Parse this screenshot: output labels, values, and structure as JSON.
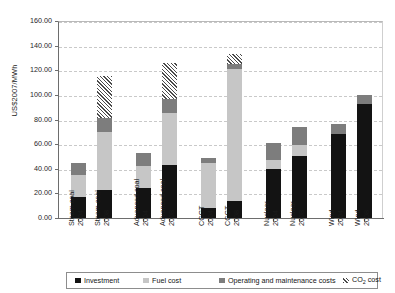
{
  "chart_data": {
    "type": "bar",
    "subtype": "stacked-bar",
    "title": "",
    "xlabel": "",
    "ylabel": "US$2007/MWh",
    "ylim": [
      0,
      160
    ],
    "ytick_step": 20,
    "ytick_labels": [
      "0.00",
      "20.00",
      "40.00",
      "60.00",
      "80.00",
      "100.00",
      "120.00",
      "140.00",
      "160.00"
    ],
    "grid": true,
    "legend_position": "bottom",
    "categories": [
      "Steam coal 2004",
      "Steam coal 2008",
      "Advanced coal 2004",
      "Advanced coal 2008",
      "CCGT 2004",
      "CCGT 2008",
      "Nuclear 2004",
      "Nuclear 2008",
      "Wind 2004",
      "Wind 2008"
    ],
    "category_lines": [
      [
        "Steam coal",
        "2004"
      ],
      [
        "Steam coal",
        "2008"
      ],
      [
        "Advanced coal",
        "2004"
      ],
      [
        "Advanced coal",
        "2008"
      ],
      [
        "CCGT",
        "2004"
      ],
      [
        "CCGT",
        "2008"
      ],
      [
        "Nuclear",
        "2004"
      ],
      [
        "Nuclear",
        "2008"
      ],
      [
        "Wind",
        "2004"
      ],
      [
        "Wind",
        "2008"
      ]
    ],
    "series": [
      {
        "name": "Investment",
        "key": "investment",
        "color": "#131313",
        "values": [
          17.0,
          23.0,
          24.0,
          43.0,
          8.0,
          14.0,
          40.0,
          50.0,
          68.0,
          93.0
        ]
      },
      {
        "name": "Fuel cost",
        "key": "fuel",
        "color": "#c6c6c6",
        "values": [
          18.0,
          47.0,
          18.0,
          42.0,
          37.0,
          107.0,
          7.0,
          9.0,
          0.0,
          0.0
        ]
      },
      {
        "name": "Operating and maintenance costs",
        "key": "om",
        "color": "#7d7d7d",
        "values": [
          10.0,
          11.0,
          11.0,
          12.0,
          4.0,
          4.0,
          14.0,
          15.0,
          8.0,
          7.0
        ]
      },
      {
        "name": "CO2 cost",
        "key": "co2",
        "color": "hatch",
        "values": [
          0.0,
          34.0,
          0.0,
          29.0,
          0.0,
          8.0,
          0.0,
          0.0,
          0.0,
          0.0
        ]
      }
    ],
    "totals": [
      45.0,
      115.0,
      53.0,
      126.0,
      49.0,
      133.0,
      61.0,
      74.0,
      76.0,
      100.0
    ]
  },
  "legend": {
    "items": [
      {
        "label": "Investment",
        "key": "investment"
      },
      {
        "label": "Fuel cost",
        "key": "fuel"
      },
      {
        "label": "Operating and maintenance costs",
        "key": "om"
      },
      {
        "label": "CO",
        "sub": "2",
        "label_tail": " cost",
        "key": "co2"
      }
    ]
  }
}
